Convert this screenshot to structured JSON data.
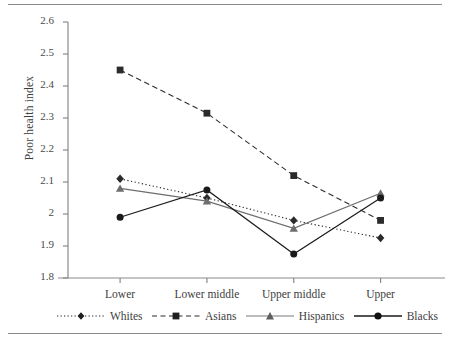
{
  "chart_data": {
    "type": "line",
    "title": "",
    "subtitle": "",
    "xlabel": "",
    "ylabel": "Poor health index",
    "categories": [
      "Lower",
      "Lower middle",
      "Upper middle",
      "Upper"
    ],
    "ylim": [
      1.8,
      2.6
    ],
    "ytick_labels": [
      "2.6",
      "2.5",
      "2.4",
      "2.3",
      "2.2",
      "2.1",
      "2",
      "1.9",
      "1.8"
    ],
    "ytick_values": [
      2.6,
      2.5,
      2.4,
      2.3,
      2.2,
      2.1,
      2.0,
      1.9,
      1.8
    ],
    "grid": false,
    "legend_position": "bottom",
    "series": [
      {
        "name": "Whites",
        "values": [
          2.11,
          2.05,
          1.98,
          1.925
        ],
        "marker": "diamond",
        "line_style": "dotted",
        "color": "#2b2b2b"
      },
      {
        "name": "Asians",
        "values": [
          2.45,
          2.315,
          2.12,
          1.98
        ],
        "marker": "square",
        "line_style": "dashed",
        "color": "#2b2b2b"
      },
      {
        "name": "Hispanics",
        "values": [
          2.08,
          2.04,
          1.955,
          2.065
        ],
        "marker": "triangle",
        "line_style": "solid",
        "color": "#6e6e6e"
      },
      {
        "name": "Blacks",
        "values": [
          1.99,
          2.075,
          1.875,
          2.05
        ],
        "marker": "circle",
        "line_style": "solid",
        "color": "#1a1a1a"
      }
    ]
  }
}
